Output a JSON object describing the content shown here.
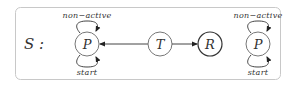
{
  "diagram": {
    "set_label": "S :",
    "colors": {
      "frame": "#c8c8c8",
      "stroke": "#444444",
      "node_stroke_light": "#777777",
      "node_stroke_dark": "#333333",
      "text": "#333333"
    },
    "nodes": [
      {
        "id": "P1",
        "label": "P",
        "cx": 87,
        "cy": 44,
        "loop_top_label": "non−active",
        "loop_bottom_label": "start"
      },
      {
        "id": "T",
        "label": "T",
        "cx": 160,
        "cy": 44
      },
      {
        "id": "R",
        "label": "R",
        "cx": 210,
        "cy": 44
      },
      {
        "id": "P2",
        "label": "P",
        "cx": 258,
        "cy": 44,
        "loop_top_label": "non−active",
        "loop_bottom_label": "start"
      }
    ],
    "edges": [
      {
        "from": "T",
        "to": "P1"
      },
      {
        "from": "T",
        "to": "R"
      },
      {
        "from": "P1",
        "to": "P1",
        "label": "non−active"
      },
      {
        "from": "P1",
        "to": "P1",
        "label": "start"
      },
      {
        "from": "P2",
        "to": "P2",
        "label": "non−active"
      },
      {
        "from": "P2",
        "to": "P2",
        "label": "start"
      }
    ]
  }
}
